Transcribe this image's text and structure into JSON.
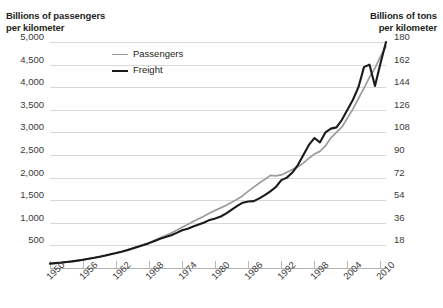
{
  "titles": {
    "left_axis": "Billions of passengers\nper kilometer",
    "right_axis": "Billions of tons\nper kilometer"
  },
  "legend": [
    {
      "label": "Passengers",
      "color": "#9b9b9b",
      "width": 1.6
    },
    {
      "label": "Freight",
      "color": "#1a1a1a",
      "width": 2.2
    }
  ],
  "axes": {
    "left_ticks": [
      "500",
      "1,000",
      "1,500",
      "2,000",
      "2,500",
      "3,000",
      "3,500",
      "4,000",
      "4,500",
      "5,000"
    ],
    "right_ticks": [
      "18",
      "36",
      "54",
      "72",
      "90",
      "108",
      "126",
      "144",
      "162",
      "180"
    ],
    "x_ticks": [
      "1950",
      "1956",
      "1962",
      "1968",
      "1974",
      "1980",
      "1986",
      "1992",
      "1998",
      "2004",
      "2010"
    ]
  },
  "chart_data": {
    "type": "line",
    "xlabel": "",
    "ylabel": "Billions of passengers per kilometer",
    "y2label": "Billions of tons per kilometer",
    "xlim": [
      1950,
      2011
    ],
    "ylim": [
      0,
      5000
    ],
    "y2lim": [
      0,
      180
    ],
    "grid": true,
    "legend_position": "top-center",
    "x": [
      1950,
      1951,
      1952,
      1953,
      1954,
      1955,
      1956,
      1957,
      1958,
      1959,
      1960,
      1961,
      1962,
      1963,
      1964,
      1965,
      1966,
      1967,
      1968,
      1969,
      1970,
      1971,
      1972,
      1973,
      1974,
      1975,
      1976,
      1977,
      1978,
      1979,
      1980,
      1981,
      1982,
      1983,
      1984,
      1985,
      1986,
      1987,
      1988,
      1989,
      1990,
      1991,
      1992,
      1993,
      1994,
      1995,
      1996,
      1997,
      1998,
      1999,
      2000,
      2001,
      2002,
      2003,
      2004,
      2005,
      2006,
      2007,
      2008,
      2009,
      2010,
      2011
    ],
    "series": [
      {
        "name": "Passengers",
        "color": "#9b9b9b",
        "axis": "left",
        "units": "billions of passenger-kilometers",
        "values": [
          95,
          105,
          118,
          130,
          145,
          162,
          180,
          200,
          222,
          245,
          270,
          300,
          330,
          365,
          400,
          440,
          480,
          520,
          565,
          615,
          670,
          720,
          775,
          835,
          900,
          965,
          1030,
          1090,
          1150,
          1215,
          1275,
          1330,
          1390,
          1455,
          1520,
          1600,
          1700,
          1790,
          1880,
          1960,
          2050,
          2040,
          2060,
          2120,
          2180,
          2240,
          2320,
          2430,
          2520,
          2580,
          2700,
          2880,
          3000,
          3120,
          3320,
          3520,
          3750,
          3980,
          4220,
          4420,
          4680,
          4900
        ]
      },
      {
        "name": "Freight",
        "color": "#1a1a1a",
        "axis": "right",
        "units": "billions of ton-kilometers",
        "values": [
          3.5,
          3.9,
          4.3,
          4.8,
          5.3,
          5.9,
          6.6,
          7.3,
          8.1,
          9.0,
          9.9,
          10.9,
          11.9,
          13.0,
          14.2,
          15.5,
          16.9,
          18.3,
          19.8,
          21.5,
          23.3,
          24.6,
          26.1,
          28.0,
          30.0,
          31.2,
          33.0,
          34.6,
          36.3,
          38.3,
          39.5,
          41.0,
          43.5,
          46.5,
          49.5,
          52.0,
          53.0,
          53.3,
          55.5,
          58.0,
          61.0,
          64.5,
          70.0,
          72.0,
          76.0,
          82.0,
          90.0,
          98.0,
          103.5,
          100.0,
          108.0,
          111.0,
          112.0,
          118.0,
          126.0,
          134.0,
          144.0,
          160.0,
          162.0,
          145.0,
          163.0,
          180.0
        ]
      }
    ]
  }
}
